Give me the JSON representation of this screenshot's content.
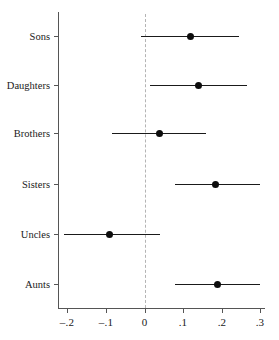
{
  "chart_data": {
    "type": "scatter",
    "subtype": "coefficient-forest-plot",
    "title": "",
    "subtitle": "",
    "xlabel": "",
    "ylabel": "",
    "categories": [
      "Sons",
      "Daughters",
      "Brothers",
      "Sisters",
      "Uncles",
      "Aunts"
    ],
    "series": [
      {
        "name": "Point estimate",
        "values": [
          0.12,
          0.14,
          0.04,
          0.185,
          -0.09,
          0.19
        ]
      },
      {
        "name": "Lower CI",
        "values": [
          -0.01,
          0.015,
          -0.085,
          0.08,
          -0.21,
          0.08
        ]
      },
      {
        "name": "Upper CI",
        "values": [
          0.245,
          0.265,
          0.16,
          0.3,
          0.04,
          0.3
        ]
      }
    ],
    "points": [
      {
        "category": "Sons",
        "estimate": 0.12,
        "ci_low": -0.01,
        "ci_high": 0.245
      },
      {
        "category": "Daughters",
        "estimate": 0.14,
        "ci_low": 0.015,
        "ci_high": 0.265
      },
      {
        "category": "Brothers",
        "estimate": 0.04,
        "ci_low": -0.085,
        "ci_high": 0.16
      },
      {
        "category": "Sisters",
        "estimate": 0.185,
        "ci_low": 0.08,
        "ci_high": 0.3
      },
      {
        "category": "Uncles",
        "estimate": -0.09,
        "ci_low": -0.21,
        "ci_high": 0.04
      },
      {
        "category": "Aunts",
        "estimate": 0.19,
        "ci_low": 0.08,
        "ci_high": 0.3
      }
    ],
    "xticks": [
      -0.2,
      -0.1,
      0,
      0.1,
      0.2,
      0.3
    ],
    "xtick_labels": [
      "–.2",
      "–.1",
      "0",
      ".1",
      ".2",
      ".3"
    ],
    "xlim": [
      -0.235,
      0.315
    ],
    "reference_line": 0,
    "grid": false,
    "legend": null,
    "colors": {
      "point": "#0d0d0d",
      "whisker": "#1a1a1a",
      "axis": "#555555",
      "reference": "#b4b4b4",
      "background": "#ffffff"
    }
  },
  "axis": {
    "x_labels": [
      "–.2",
      "–.1",
      "0",
      ".1",
      ".2",
      ".3"
    ],
    "y_labels": [
      "Sons",
      "Daughters",
      "Brothers",
      "Sisters",
      "Uncles",
      "Aunts"
    ]
  }
}
